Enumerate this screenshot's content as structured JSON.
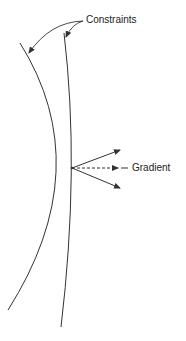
{
  "diagram": {
    "type": "constraint-gradient-illustration",
    "labels": {
      "constraints": "Constraints",
      "gradient": "Gradient"
    },
    "colors": {
      "stroke": "#333333",
      "text": "#222222",
      "background": "#ffffff"
    },
    "elements": {
      "constraint_curves": 2,
      "solid_arrows": 2,
      "dashed_arrows": 1,
      "intersection_point": [
        72,
        168
      ]
    }
  }
}
